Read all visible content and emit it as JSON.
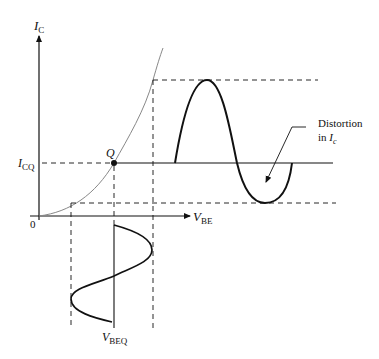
{
  "diagram": {
    "axes": {
      "y_label": "I",
      "y_label_sub": "C",
      "x_label": "V",
      "x_label_sub": "BE",
      "origin_label": "0"
    },
    "labels": {
      "icq": "I",
      "icq_sub": "CQ",
      "q_point": "Q",
      "vbeq": "V",
      "vbeq_sub": "BEQ",
      "annotation_line1": "Distortion",
      "annotation_line2_prefix": "in ",
      "annotation_line2_var": "I",
      "annotation_line2_sub": "c"
    },
    "colors": {
      "curve": "#888888",
      "lines": "#111111",
      "background": "#ffffff"
    }
  }
}
